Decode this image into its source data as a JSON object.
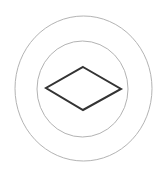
{
  "figure": {
    "background": "#ffffff",
    "outer_circle": {
      "cx": 83.5,
      "cy": 88.5,
      "rx": 68.5,
      "ry": 72.5,
      "stroke": "#b3b3b3",
      "stroke_width": 1
    },
    "inner_circle": {
      "cx": 82.5,
      "cy": 89,
      "rx": 45.5,
      "ry": 48,
      "stroke": "#b3b3b3",
      "stroke_width": 1
    },
    "diamond": {
      "points": "83,67 121,89 83,110 46,88",
      "stroke": "#333333",
      "stroke_width": 2,
      "fill": "none"
    }
  }
}
